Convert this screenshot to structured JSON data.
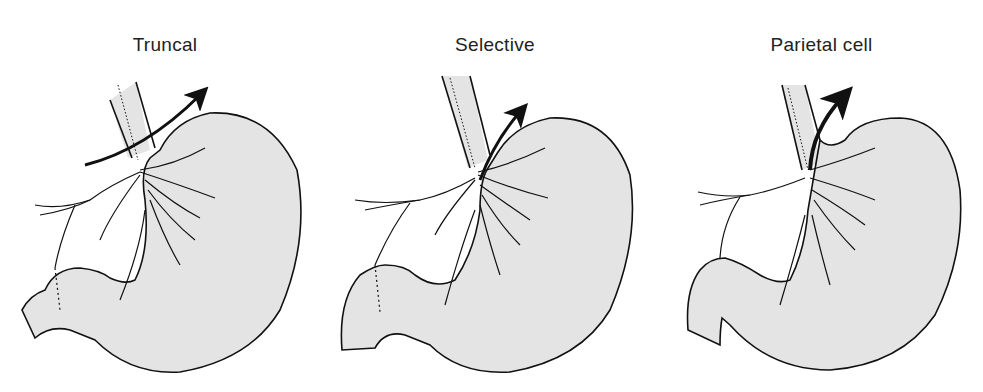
{
  "figure": {
    "panels": [
      {
        "id": "truncal",
        "title": "Truncal",
        "description": "Truncal vagotomy with pyloroplasty: arrow crosses both vagal trunks above all branches"
      },
      {
        "id": "selective",
        "title": "Selective",
        "description": "Selective vagotomy with pyloroplasty: arrow divides gastric branches below hepatic/celiac branches"
      },
      {
        "id": "parietal-cell",
        "title": "Parietal cell",
        "description": "Parietal cell (highly selective) vagotomy: arrow follows lesser curve, sparing nerves of Latarjet to antrum; no pyloroplasty"
      }
    ],
    "colors": {
      "stomach_fill": "#e4e4e4",
      "outline": "#111111",
      "background": "#ffffff"
    }
  }
}
